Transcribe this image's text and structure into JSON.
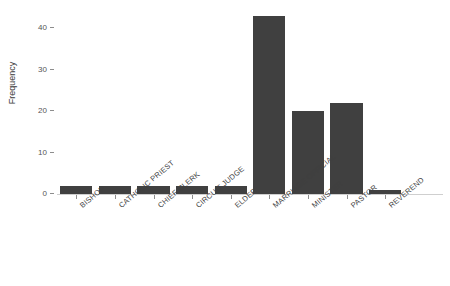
{
  "chart_data": {
    "type": "bar",
    "title": "",
    "clipped_top_text": "",
    "xlabel": "",
    "ylabel": "Frequency",
    "categories": [
      "BISHOP",
      "CATHOLIC PRIEST",
      "CHIEF CLERK",
      "CIRCUIT JUDGE",
      "ELDER",
      "MARRIAGE OFFICIAL",
      "MINISTER",
      "PASTOR",
      "REVEREND"
    ],
    "values": [
      2,
      2,
      2,
      2,
      2,
      43,
      20,
      22,
      1
    ],
    "ylim": [
      0,
      45
    ],
    "yticks": [
      0,
      10,
      20,
      30,
      40
    ],
    "ytick_labels": [
      "0",
      "10",
      "20",
      "30",
      "40"
    ],
    "grid": false,
    "legend": null,
    "bar_color": "#404040",
    "background_color": "#ffffff",
    "axis_color": "#8d8d8d",
    "text_color": "#3f3f3f"
  }
}
